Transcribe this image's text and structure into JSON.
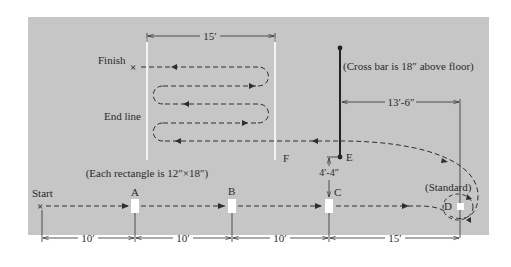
{
  "diagram": {
    "background_color": "#c6c6c6",
    "line_color": "#2e2e2e",
    "marker_color": "#ffffff",
    "labels": {
      "finish": "Finish",
      "start": "Start",
      "end_line": "End line",
      "cross_bar_note": "(Cross bar is 18″ above floor)",
      "rectangle_note": "(Each rectangle is 12″×18″)",
      "standard": "(Standard)"
    },
    "points": {
      "A": "A",
      "B": "B",
      "C": "C",
      "D": "D",
      "E": "E",
      "F": "F"
    },
    "dimensions": {
      "end_line_width": "15′",
      "crossbar_to_standard": "13′-6″",
      "c_to_e": "4′-4″",
      "start_to_a": "10′",
      "a_to_b": "10′",
      "b_to_c": "10′",
      "c_to_d": "15′"
    }
  }
}
